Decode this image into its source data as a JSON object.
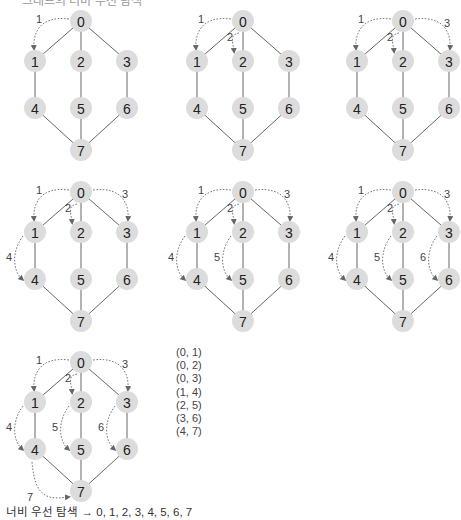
{
  "diagram": {
    "title_cut": "그래프의 너비 우선 탐색",
    "node_labels": [
      "0",
      "1",
      "2",
      "3",
      "4",
      "5",
      "6",
      "7"
    ],
    "node_positions": [
      [
        81,
        21
      ],
      [
        35,
        61
      ],
      [
        81,
        61
      ],
      [
        127,
        61
      ],
      [
        35,
        108
      ],
      [
        81,
        108
      ],
      [
        127,
        108
      ],
      [
        81,
        150
      ]
    ],
    "node_radius": 11,
    "graph_edges": [
      [
        0,
        1
      ],
      [
        0,
        2
      ],
      [
        0,
        3
      ],
      [
        1,
        4
      ],
      [
        2,
        5
      ],
      [
        3,
        6
      ],
      [
        4,
        7
      ],
      [
        5,
        7
      ],
      [
        6,
        7
      ]
    ],
    "panels": [
      {
        "offset": [
          0,
          0
        ],
        "steps": 1
      },
      {
        "offset": [
          162,
          0
        ],
        "steps": 2
      },
      {
        "offset": [
          322,
          0
        ],
        "steps": 3
      },
      {
        "offset": [
          0,
          171
        ],
        "steps": 4
      },
      {
        "offset": [
          162,
          171
        ],
        "steps": 5
      },
      {
        "offset": [
          322,
          171
        ],
        "steps": 6
      },
      {
        "offset": [
          0,
          341
        ],
        "steps": 7
      }
    ],
    "traversal_steps": [
      {
        "label": "1",
        "from": 0,
        "to": 1
      },
      {
        "label": "2",
        "from": 0,
        "to": 2
      },
      {
        "label": "3",
        "from": 0,
        "to": 3
      },
      {
        "label": "4",
        "from": 1,
        "to": 4
      },
      {
        "label": "5",
        "from": 2,
        "to": 5
      },
      {
        "label": "6",
        "from": 3,
        "to": 6
      },
      {
        "label": "7",
        "from": 4,
        "to": 7
      }
    ],
    "colors": {
      "node_fill": "#dcdcdc",
      "edge": "#555555",
      "traversal_arrow": "#777777"
    }
  },
  "edge_list": [
    "(0, 1)",
    "(0, 2)",
    "(0, 3)",
    "(1, 4)",
    "(2, 5)",
    "(3, 6)",
    "(4, 7)"
  ],
  "caption": "너비 우선 탐색 → 0, 1, 2, 3, 4, 5, 6, 7"
}
